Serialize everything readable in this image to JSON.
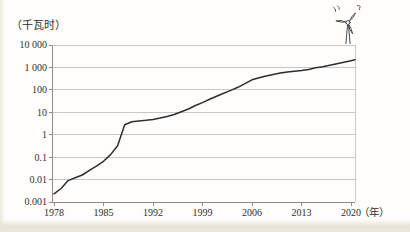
{
  "page": {
    "background": "#fffefd",
    "edge_tint": "#e7e3d9"
  },
  "icons": {
    "corner_icon": "wind-turbine-icon"
  },
  "colors": {
    "curve": "#2d2d2d",
    "gridline": "#c7c7c7",
    "axis": "#8c8c8c",
    "text": "#2f2f2f",
    "icon_stroke": "#4a4a4a"
  },
  "chart_data": {
    "type": "line",
    "title": "",
    "ylabel": "（千瓦时）",
    "xlabel": "（年）",
    "y_scale": "log",
    "ylim": [
      0.001,
      10000
    ],
    "xlim": [
      1978,
      2020
    ],
    "grid": "horizontal",
    "legend": "none",
    "x_ticks": [
      {
        "value": 1978,
        "label": "1978"
      },
      {
        "value": 1985,
        "label": "1985"
      },
      {
        "value": 1992,
        "label": "1992"
      },
      {
        "value": 1999,
        "label": "1999"
      },
      {
        "value": 2006,
        "label": "2006"
      },
      {
        "value": 2013,
        "label": "2013"
      },
      {
        "value": 2020,
        "label": "2020"
      }
    ],
    "y_ticks": [
      {
        "value": 10000,
        "label": "10 000"
      },
      {
        "value": 1000,
        "label": "1 000"
      },
      {
        "value": 100,
        "label": "100"
      },
      {
        "value": 10,
        "label": "10"
      },
      {
        "value": 1,
        "label": "1"
      },
      {
        "value": 0.1,
        "label": "0.1"
      },
      {
        "value": 0.01,
        "label": "0.01"
      },
      {
        "value": 0.001,
        "label": "0.001"
      }
    ],
    "series": [
      {
        "name": "line-series",
        "color": "#2d2d2d",
        "points": [
          [
            1978,
            0.0023
          ],
          [
            1979,
            0.004
          ],
          [
            1980,
            0.009
          ],
          [
            1981,
            0.012
          ],
          [
            1982,
            0.016
          ],
          [
            1983,
            0.026
          ],
          [
            1984,
            0.04
          ],
          [
            1985,
            0.065
          ],
          [
            1986,
            0.13
          ],
          [
            1987,
            0.32
          ],
          [
            1988,
            2.8
          ],
          [
            1989,
            3.8
          ],
          [
            1990,
            4.1
          ],
          [
            1991,
            4.4
          ],
          [
            1992,
            4.8
          ],
          [
            1993,
            5.5
          ],
          [
            1994,
            6.5
          ],
          [
            1995,
            8
          ],
          [
            1996,
            10.5
          ],
          [
            1997,
            14
          ],
          [
            1998,
            20
          ],
          [
            1999,
            27
          ],
          [
            2000,
            38
          ],
          [
            2001,
            52
          ],
          [
            2002,
            70
          ],
          [
            2003,
            95
          ],
          [
            2004,
            130
          ],
          [
            2005,
            190
          ],
          [
            2006,
            280
          ],
          [
            2007,
            350
          ],
          [
            2008,
            420
          ],
          [
            2009,
            490
          ],
          [
            2010,
            560
          ],
          [
            2011,
            630
          ],
          [
            2012,
            680
          ],
          [
            2013,
            730
          ],
          [
            2014,
            820
          ],
          [
            2015,
            960
          ],
          [
            2016,
            1080
          ],
          [
            2017,
            1250
          ],
          [
            2018,
            1450
          ],
          [
            2019,
            1700
          ],
          [
            2020,
            2000
          ]
        ]
      }
    ]
  }
}
